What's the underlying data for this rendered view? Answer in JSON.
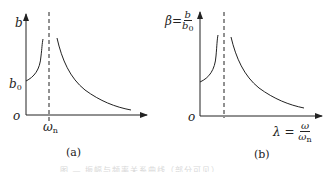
{
  "figure": {
    "panel_a": {
      "y_axis_label": "b",
      "y_tick_label": {
        "main": "b",
        "sub": "0"
      },
      "origin_label": "o",
      "x_tick_label": {
        "main": "ω",
        "sub": "n"
      },
      "caption": "(a)"
    },
    "panel_b": {
      "y_axis_label": {
        "symbol": "β=",
        "num": "b",
        "den_main": "b",
        "den_sub": "0"
      },
      "origin_label": "o",
      "x_axis_label": {
        "symbol": "λ =",
        "num": "ω",
        "den_main": "ω",
        "den_sub": "n"
      },
      "caption": "(b)"
    },
    "bottom_caption": "图 — 振幅与频率关系曲线（部分可见）"
  },
  "colors": {
    "line": "#222222",
    "background": "#ffffff"
  }
}
